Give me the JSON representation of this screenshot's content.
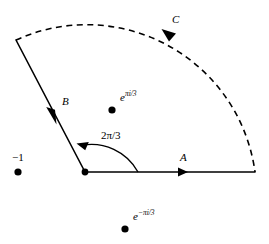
{
  "figure": {
    "background_color": "#ffffff",
    "stroke_color": "#000000",
    "labels": {
      "path_a": "A",
      "path_b": "B",
      "path_c": "C",
      "angle": "2π/3",
      "point_minus_one": "−1",
      "point_upper_base": "e",
      "point_upper_exponent": "πi/3",
      "point_lower_base": "e",
      "point_lower_exponent": "−πi/3"
    },
    "geometry": {
      "origin": {
        "x": 85,
        "y": 172
      },
      "radius": 170,
      "sector_angle_degrees": 120,
      "ray_a_end": {
        "x": 255,
        "y": 172
      },
      "ray_b_end": {
        "x": 16,
        "y": 40
      },
      "arc_style": "dashed",
      "ray_style": "solid"
    },
    "marked_points": [
      {
        "name": "minus-one",
        "x": 18,
        "y": 172,
        "label": "−1"
      },
      {
        "name": "origin",
        "x": 85,
        "y": 172,
        "label": ""
      },
      {
        "name": "e-pi-i-over-3",
        "x": 112,
        "y": 110,
        "label": "e^{πi/3}"
      },
      {
        "name": "e-minus-pi-i-over-3",
        "x": 125,
        "y": 229,
        "label": "e^{−πi/3}"
      }
    ],
    "arrows": [
      {
        "name": "arrow-a",
        "on": "A",
        "direction": "right",
        "x": 186,
        "y": 172
      },
      {
        "name": "arrow-b",
        "on": "B",
        "direction": "down-left",
        "x": 54,
        "y": 116
      },
      {
        "name": "arrow-c",
        "on": "C",
        "direction": "left-down",
        "x": 170,
        "y": 34
      },
      {
        "name": "arrow-angle",
        "on": "angle-arc",
        "direction": "up-left",
        "x": 78,
        "y": 143
      }
    ]
  }
}
